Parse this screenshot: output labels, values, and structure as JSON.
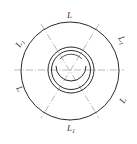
{
  "diagram": {
    "title": "",
    "labels": {
      "top": "L",
      "upper_left": "L",
      "upper_left_sub": "1",
      "upper_right": "L",
      "upper_right_sub": "1",
      "lower_left": "L",
      "lower_right": "L",
      "bottom": "L",
      "bottom_sub": "1"
    },
    "colors": {
      "stroke": "#2a2a2a",
      "centerline": "#888888",
      "background": "#ffffff"
    }
  }
}
